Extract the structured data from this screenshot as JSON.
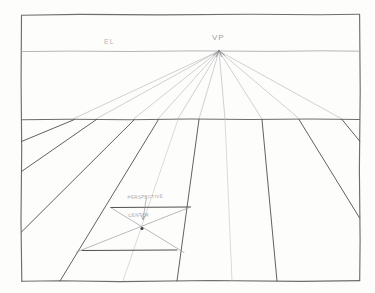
{
  "drawing": {
    "medium": "pencil sketch on paper",
    "paper_color": "#fdfdfc",
    "frame": {
      "stroke": "#6e6e70",
      "left": 21,
      "top": 14,
      "right": 360,
      "bottom": 281
    },
    "labels": {
      "eye_level": "EL",
      "vanishing_point": "VP",
      "perspective_center_line1": "PERSPECTIVE",
      "perspective_center_line2": "CENTER"
    },
    "geometry": {
      "horizon_y": 51,
      "ground_line_y": 119,
      "vanishing_point_x": 219,
      "vanishing_point_y": 51
    },
    "colors": {
      "frame_stroke": "#6e6e70",
      "horizon_stroke": "#a9a9ac",
      "ground_stroke": "#6d6d70",
      "ray_stroke": "#b5b5b8",
      "converging_stroke": "#58585b",
      "diagonal_stroke": "#9a9a9d",
      "text": "#8d8d8f"
    }
  }
}
